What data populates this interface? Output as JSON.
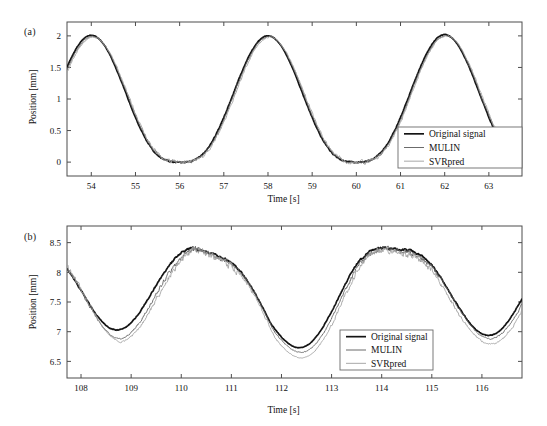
{
  "figure": {
    "background_color": "#ffffff",
    "width": 547,
    "height": 426
  },
  "panels": [
    {
      "id": "a",
      "label": "(a)",
      "legend_title": "",
      "legend": [
        "Original signal",
        "MULIN",
        "SVRpred"
      ]
    },
    {
      "id": "b",
      "label": "(b)",
      "legend_title": "",
      "legend": [
        "Original signal",
        "MULIN",
        "SVRpred"
      ]
    }
  ],
  "colors": {
    "original_signal": "#141414",
    "mulin": "#5a5a5a",
    "svrpred": "#9e9e9e",
    "axis": "#4d4d4d",
    "text": "#111111"
  },
  "chart_data": [
    {
      "type": "line",
      "panel": "a",
      "title": "",
      "xlabel": "Time [s]",
      "ylabel": "Position [mm]",
      "xlim": [
        53.45,
        63.75
      ],
      "ylim": [
        -0.22,
        2.22
      ],
      "xticks": [
        54,
        55,
        56,
        57,
        58,
        59,
        60,
        61,
        62,
        63
      ],
      "xticklabels": [
        "54",
        "55",
        "56",
        "57",
        "58",
        "59",
        "60",
        "61",
        "62",
        "63"
      ],
      "yticks": [
        0,
        0.5,
        1,
        1.5,
        2
      ],
      "yticklabels": [
        "0",
        "0.5",
        "1",
        "1.5",
        "2"
      ],
      "grid": false,
      "legend_position": "lower right",
      "waveform": {
        "description": "breathing-like cycle, sharp-topped peaks with long flat valleys near 0 mm",
        "period": 4.0,
        "peak_time_reference": 54.0,
        "peak_value": 2.0,
        "valley_value": 0.0,
        "exponent": 3.0,
        "noise_amplitude": {
          "original_signal": 0.012,
          "mulin": 0.03,
          "svrpred": 0.038
        },
        "lag": {
          "original_signal": 0.0,
          "mulin": 0.02,
          "svrpred": 0.04
        }
      },
      "series": [
        {
          "name": "Original signal",
          "color": "#141414",
          "width": 1.7,
          "peaks": [
            {
              "t": 54.0,
              "y": 2.01
            },
            {
              "t": 58.0,
              "y": 2.0
            },
            {
              "t": 62.0,
              "y": 2.02
            }
          ],
          "valleys": [
            {
              "t": 56.0,
              "y": 0.02
            },
            {
              "t": 60.0,
              "y": 0.02
            }
          ],
          "edge_values": [
            {
              "t": 53.45,
              "y": 1.33
            },
            {
              "t": 63.75,
              "y": 0.06
            }
          ]
        },
        {
          "name": "MULIN",
          "color": "#5a5a5a",
          "width": 0.9,
          "peaks": [
            {
              "t": 54.02,
              "y": 1.99
            },
            {
              "t": 58.02,
              "y": 1.99
            },
            {
              "t": 62.02,
              "y": 2.0
            }
          ],
          "valleys": [
            {
              "t": 56.02,
              "y": 0.02
            },
            {
              "t": 60.02,
              "y": 0.02
            }
          ],
          "edge_values": [
            {
              "t": 53.45,
              "y": 1.3
            },
            {
              "t": 63.75,
              "y": 0.06
            }
          ]
        },
        {
          "name": "SVRpred",
          "color": "#9e9e9e",
          "width": 0.9,
          "peaks": [
            {
              "t": 54.04,
              "y": 1.98
            },
            {
              "t": 58.04,
              "y": 1.98
            },
            {
              "t": 62.04,
              "y": 2.0
            }
          ],
          "valleys": [
            {
              "t": 56.04,
              "y": 0.03
            },
            {
              "t": 60.04,
              "y": 0.03
            }
          ],
          "edge_values": [
            {
              "t": 53.45,
              "y": 1.28
            },
            {
              "t": 63.75,
              "y": 0.07
            }
          ]
        }
      ]
    },
    {
      "type": "line",
      "panel": "b",
      "title": "",
      "xlabel": "Time [s]",
      "ylabel": "Position [mm]",
      "xlim": [
        107.72,
        116.8
      ],
      "ylim": [
        6.22,
        8.78
      ],
      "xticks": [
        108,
        109,
        110,
        111,
        112,
        113,
        114,
        115,
        116
      ],
      "xticklabels": [
        "108",
        "109",
        "110",
        "111",
        "112",
        "113",
        "114",
        "115",
        "116"
      ],
      "yticks": [
        6.5,
        7,
        7.5,
        8,
        8.5
      ],
      "yticklabels": [
        "6.5",
        "7",
        "7.5",
        "8",
        "8.5"
      ],
      "grid": false,
      "legend_position": "lower right",
      "waveform": {
        "description": "inverted breathing cycle: broad noisy plateau near 8.4-8.6 mm with sharp downward troughs",
        "period": 3.72,
        "trough_time_reference": 108.72,
        "plateau_value": 8.45,
        "trough_value": 7.02,
        "exponent": 3.2,
        "noise_amplitude": {
          "original_signal": 0.022,
          "mulin": 0.055,
          "svrpred": 0.075
        },
        "lag": {
          "original_signal": 0.0,
          "mulin": 0.05,
          "svrpred": 0.09
        }
      },
      "series": [
        {
          "name": "Original signal",
          "color": "#141414",
          "width": 1.7,
          "troughs": [
            {
              "t": 108.7,
              "y": 7.03
            },
            {
              "t": 111.78,
              "y": 6.56
            },
            {
              "t": 115.4,
              "y": 6.87
            }
          ],
          "plateaus": [
            {
              "t": 110.4,
              "y": 8.55
            },
            {
              "t": 114.0,
              "y": 8.57
            },
            {
              "t": 116.4,
              "y": 8.32
            }
          ],
          "edge_values": [
            {
              "t": 107.72,
              "y": 8.33
            },
            {
              "t": 116.8,
              "y": 8.33
            }
          ]
        },
        {
          "name": "MULIN",
          "color": "#5a5a5a",
          "width": 0.85,
          "troughs": [
            {
              "t": 108.74,
              "y": 6.88
            },
            {
              "t": 111.84,
              "y": 6.45
            },
            {
              "t": 115.45,
              "y": 6.78
            }
          ],
          "plateaus": [
            {
              "t": 110.4,
              "y": 8.52
            },
            {
              "t": 114.0,
              "y": 8.58
            },
            {
              "t": 116.4,
              "y": 8.35
            }
          ],
          "edge_values": [
            {
              "t": 107.72,
              "y": 8.35
            },
            {
              "t": 116.8,
              "y": 8.36
            }
          ]
        },
        {
          "name": "SVRpred",
          "color": "#9e9e9e",
          "width": 0.85,
          "troughs": [
            {
              "t": 108.78,
              "y": 6.83
            },
            {
              "t": 111.88,
              "y": 6.31
            },
            {
              "t": 115.5,
              "y": 6.62
            }
          ],
          "plateaus": [
            {
              "t": 110.4,
              "y": 8.5
            },
            {
              "t": 114.1,
              "y": 8.6
            },
            {
              "t": 116.4,
              "y": 8.38
            }
          ],
          "edge_values": [
            {
              "t": 107.72,
              "y": 8.37
            },
            {
              "t": 116.8,
              "y": 8.38
            }
          ]
        }
      ]
    }
  ]
}
